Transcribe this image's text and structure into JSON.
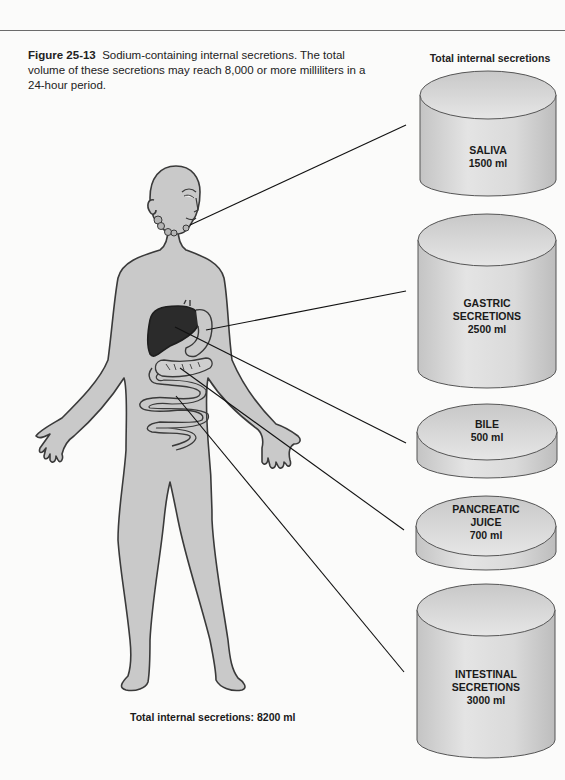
{
  "figure": {
    "number": "Figure 25-13",
    "caption": "Sodium-containing internal secretions. The total volume of these secretions may reach 8,000 or more milliliters in a 24-hour period."
  },
  "column_title": "Total internal secretions",
  "total_label": "Total internal secretions: 8200 ml",
  "secretions": [
    {
      "name": "SALIVA",
      "line2": "",
      "volume": "1500 ml",
      "ml": 1500,
      "source": "salivary glands"
    },
    {
      "name": "GASTRIC",
      "line2": "SECRETIONS",
      "volume": "2500 ml",
      "ml": 2500,
      "source": "stomach"
    },
    {
      "name": "BILE",
      "line2": "",
      "volume": "500 ml",
      "ml": 500,
      "source": "liver"
    },
    {
      "name": "PANCREATIC",
      "line2": "JUICE",
      "volume": "700 ml",
      "ml": 700,
      "source": "pancreas"
    },
    {
      "name": "INTESTINAL",
      "line2": "SECRETIONS",
      "volume": "3000 ml",
      "ml": 3000,
      "source": "small intestine"
    }
  ],
  "colors": {
    "body_fill": "#c9c9c9",
    "outline": "#3a3a3a",
    "liver": "#2b2b2b",
    "cylinder": "#dcdcdc",
    "leader_line": "#111111"
  }
}
